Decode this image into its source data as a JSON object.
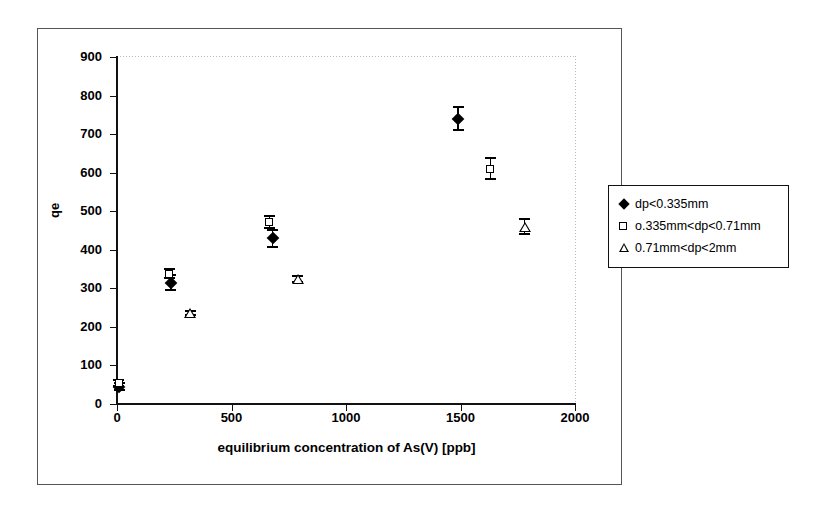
{
  "chart_data": {
    "type": "scatter",
    "title": "",
    "xlabel": "equilibrium concentration of As(V) [ppb]",
    "ylabel": "qe",
    "xlim": [
      0,
      2000
    ],
    "ylim": [
      0,
      900
    ],
    "xticks": [
      0,
      500,
      1000,
      1500,
      2000
    ],
    "yticks": [
      0,
      100,
      200,
      300,
      400,
      500,
      600,
      700,
      800,
      900
    ],
    "grid": false,
    "legend_position": "right-outside",
    "series": [
      {
        "name": "dp<0.335mm",
        "marker": "filled-diamond",
        "points": [
          {
            "x": 10,
            "y": 45,
            "yerr": 12
          },
          {
            "x": 235,
            "y": 315,
            "yerr": 22
          },
          {
            "x": 680,
            "y": 430,
            "yerr": 25
          },
          {
            "x": 1490,
            "y": 740,
            "yerr": 32
          }
        ]
      },
      {
        "name": "o.335mm<dp<0.71mm",
        "marker": "open-square",
        "points": [
          {
            "x": 8,
            "y": 55,
            "yerr": 10
          },
          {
            "x": 228,
            "y": 338,
            "yerr": 14
          },
          {
            "x": 665,
            "y": 473,
            "yerr": 18
          },
          {
            "x": 1630,
            "y": 610,
            "yerr": 30
          }
        ]
      },
      {
        "name": "0.71mm<dp<2mm",
        "marker": "open-triangle",
        "points": [
          {
            "x": 320,
            "y": 237,
            "yerr": 8
          },
          {
            "x": 790,
            "y": 325,
            "yerr": 10
          },
          {
            "x": 1780,
            "y": 460,
            "yerr": 22
          }
        ]
      }
    ]
  },
  "axes": {
    "y_labels": [
      "900",
      "800",
      "700",
      "600",
      "500",
      "400",
      "300",
      "200",
      "100",
      "0"
    ],
    "x_labels": [
      "0",
      "500",
      "1000",
      "1500",
      "2000"
    ],
    "y_title": "qe",
    "x_title": "equilibrium concentration of As(V) [ppb]"
  },
  "legend": {
    "entries": [
      {
        "label": "dp<0.335mm",
        "marker": "filled-diamond"
      },
      {
        "label": "o.335mm<dp<0.71mm",
        "marker": "open-square"
      },
      {
        "label": "0.71mm<dp<2mm",
        "marker": "open-triangle"
      }
    ]
  },
  "colors": {
    "marker": "#000000",
    "axis": "#111111",
    "plot_border": "#b9b9b9",
    "frame": "#555555",
    "background": "#ffffff"
  }
}
